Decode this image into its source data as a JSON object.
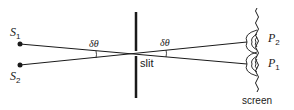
{
  "diagram": {
    "labels": {
      "source_1": "S",
      "source_1_sub": "1",
      "source_2": "S",
      "source_2_sub": "2",
      "angle_left": "δθ",
      "angle_right": "δθ",
      "slit": "slit",
      "point_2": "P",
      "point_2_sub": "2",
      "point_1": "P",
      "point_1_sub": "1",
      "screen": "screen"
    },
    "colors": {
      "line": "#1a1a1a",
      "background": "#ffffff"
    }
  }
}
